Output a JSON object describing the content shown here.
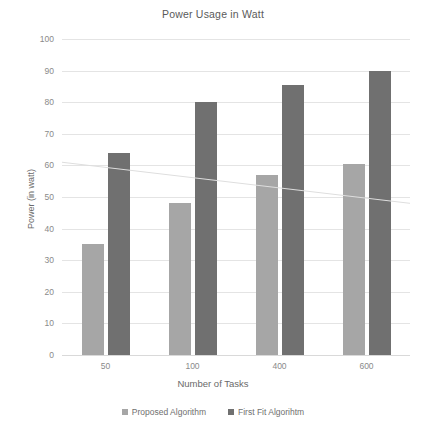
{
  "chart_data": {
    "type": "bar",
    "title": "Power Usage in Watt",
    "xlabel": "Number of Tasks",
    "ylabel": "Power (in watt)",
    "categories": [
      "50",
      "100",
      "400",
      "600"
    ],
    "series": [
      {
        "name": "Proposed Algorithm",
        "color": "#a6a6a6",
        "values": [
          35,
          48,
          57,
          60.5
        ]
      },
      {
        "name": "First Fit Algorihtm",
        "color": "#707070",
        "values": [
          64,
          80,
          85.5,
          90
        ]
      }
    ],
    "ylim": [
      0,
      100
    ],
    "ytick_labels": [
      "0",
      "10",
      "20",
      "30",
      "40",
      "50",
      "60",
      "70",
      "80",
      "90",
      "100"
    ],
    "ytick_values": [
      0,
      10,
      20,
      30,
      40,
      50,
      60,
      70,
      80,
      90,
      100
    ],
    "grid": true,
    "legend_position": "bottom",
    "annotations": [
      {
        "name": "scan-artifact-line",
        "description": "faint diagonal line across plot",
        "start_value": 61,
        "end_value": 48
      }
    ]
  }
}
